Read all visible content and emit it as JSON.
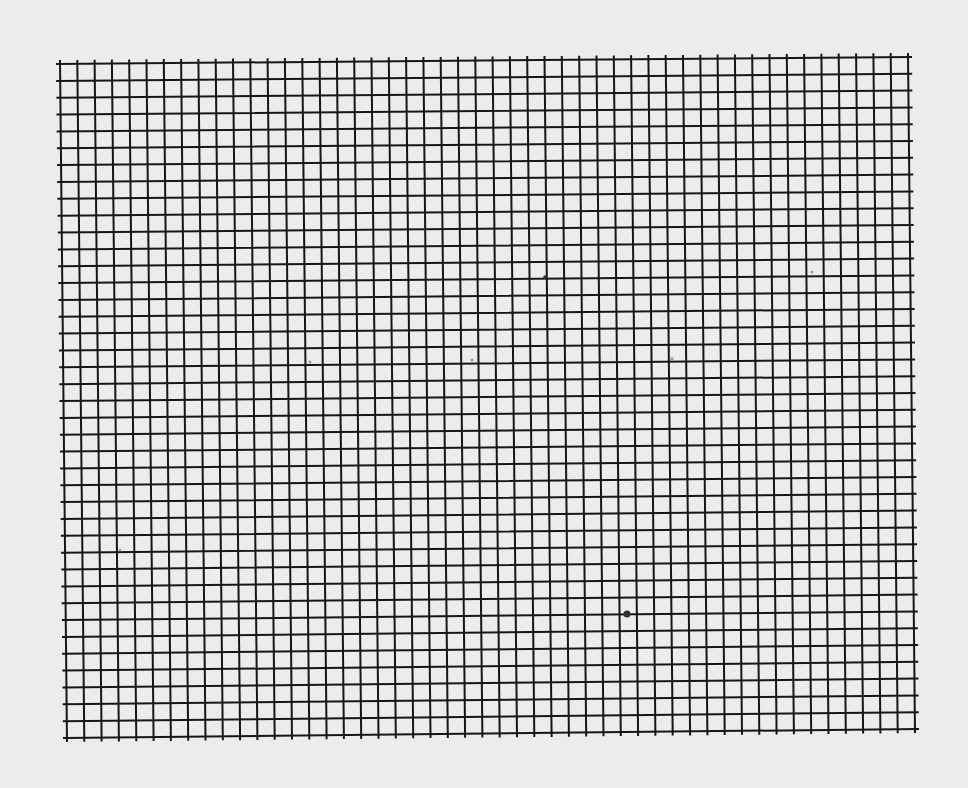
{
  "paper": {
    "background_color": "#ececec",
    "line_color": "#161616"
  },
  "grid": {
    "columns": 49,
    "rows": 40,
    "corners": {
      "top_left": [
        60,
        64
      ],
      "top_right": [
        908,
        57
      ],
      "bottom_left": [
        67,
        738
      ],
      "bottom_right": [
        915,
        729
      ]
    },
    "line_width": 2,
    "tick_overhang": 3
  },
  "specks": [
    {
      "x": 627,
      "y": 614,
      "r": 3.5,
      "faint": false
    },
    {
      "x": 545,
      "y": 277,
      "r": 1.8,
      "faint": false
    },
    {
      "x": 310,
      "y": 362,
      "r": 1.5,
      "faint": true
    },
    {
      "x": 472,
      "y": 360,
      "r": 1.5,
      "faint": true
    },
    {
      "x": 672,
      "y": 359,
      "r": 1.8,
      "faint": true
    },
    {
      "x": 812,
      "y": 272,
      "r": 1.5,
      "faint": true
    },
    {
      "x": 120,
      "y": 550,
      "r": 1.2,
      "faint": true
    }
  ]
}
